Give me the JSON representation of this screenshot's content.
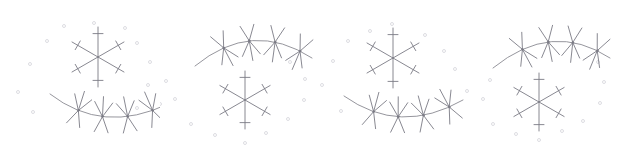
{
  "figure": {
    "background_color": "#ffffff",
    "stroke_color": "#7b7b84",
    "arc_stroke_color": "#8a8a92",
    "speck_color": "#cfcfd6",
    "width": 639,
    "height": 163,
    "panel_count": 4,
    "panel_width": 160
  },
  "panels": [
    {
      "id": "panel-1",
      "x": 0,
      "layout": "star-top-arc-bottom",
      "star": {
        "center_x": 98,
        "center_y": 57,
        "spoke_length": 30,
        "spoke_count": 6,
        "spoke_angles_deg": [
          90,
          30,
          330,
          270,
          210,
          150
        ],
        "barb_position_fraction": 0.78,
        "barb_half_length": 5
      },
      "arc": {
        "start_x": 50,
        "start_y": 94,
        "ctrl_x": 103,
        "ctrl_y": 135,
        "end_x": 168,
        "end_y": 104,
        "orientation": "concave-up",
        "node_count": 4,
        "node_fractions": [
          0.26,
          0.47,
          0.68,
          0.88
        ],
        "branch_up_length": 20,
        "branch_down_length": 18
      },
      "specks": [
        {
          "x": 47,
          "y": 41
        },
        {
          "x": 64,
          "y": 26
        },
        {
          "x": 94,
          "y": 23
        },
        {
          "x": 125,
          "y": 28
        },
        {
          "x": 137,
          "y": 43
        },
        {
          "x": 150,
          "y": 62
        },
        {
          "x": 148,
          "y": 85
        },
        {
          "x": 30,
          "y": 64
        },
        {
          "x": 18,
          "y": 92
        },
        {
          "x": 33,
          "y": 112
        },
        {
          "x": 137,
          "y": 108
        }
      ]
    },
    {
      "id": "panel-2",
      "x": 160,
      "layout": "arc-top-star-bottom",
      "star": {
        "center_x": 245,
        "center_y": 100,
        "spoke_length": 29,
        "spoke_count": 6,
        "spoke_angles_deg": [
          90,
          30,
          330,
          270,
          210,
          150
        ],
        "barb_position_fraction": 0.78,
        "barb_half_length": 5
      },
      "arc": {
        "start_x": 195,
        "start_y": 66,
        "ctrl_x": 252,
        "ctrl_y": 19,
        "end_x": 312,
        "end_y": 58,
        "orientation": "concave-down",
        "node_count": 4,
        "node_fractions": [
          0.25,
          0.47,
          0.69,
          0.9
        ],
        "branch_up_length": 20,
        "branch_down_length": 18
      },
      "specks": [
        {
          "x": 166,
          "y": 81
        },
        {
          "x": 175,
          "y": 99
        },
        {
          "x": 191,
          "y": 124
        },
        {
          "x": 215,
          "y": 135
        },
        {
          "x": 245,
          "y": 143
        },
        {
          "x": 266,
          "y": 133
        },
        {
          "x": 288,
          "y": 119
        },
        {
          "x": 304,
          "y": 100
        },
        {
          "x": 305,
          "y": 79
        },
        {
          "x": 160,
          "y": 104
        },
        {
          "x": 290,
          "y": 62
        }
      ]
    },
    {
      "id": "panel-3",
      "x": 320,
      "layout": "star-top-arc-bottom",
      "star": {
        "center_x": 393,
        "center_y": 58,
        "spoke_length": 30,
        "spoke_count": 6,
        "spoke_angles_deg": [
          90,
          30,
          330,
          270,
          210,
          150
        ],
        "barb_position_fraction": 0.78,
        "barb_half_length": 5
      },
      "arc": {
        "start_x": 344,
        "start_y": 96,
        "ctrl_x": 400,
        "ctrl_y": 136,
        "end_x": 463,
        "end_y": 100,
        "orientation": "concave-up",
        "node_count": 4,
        "node_fractions": [
          0.26,
          0.47,
          0.68,
          0.89
        ],
        "branch_up_length": 20,
        "branch_down_length": 18
      },
      "specks": [
        {
          "x": 392,
          "y": 24
        },
        {
          "x": 370,
          "y": 31
        },
        {
          "x": 348,
          "y": 41
        },
        {
          "x": 425,
          "y": 35
        },
        {
          "x": 444,
          "y": 51
        },
        {
          "x": 455,
          "y": 69
        },
        {
          "x": 467,
          "y": 91
        },
        {
          "x": 333,
          "y": 61
        },
        {
          "x": 322,
          "y": 85
        },
        {
          "x": 341,
          "y": 111
        }
      ]
    },
    {
      "id": "panel-4",
      "x": 480,
      "layout": "arc-top-star-bottom",
      "star": {
        "center_x": 539,
        "center_y": 102,
        "spoke_length": 29,
        "spoke_count": 6,
        "spoke_angles_deg": [
          90,
          30,
          330,
          270,
          210,
          150
        ],
        "barb_position_fraction": 0.78,
        "barb_half_length": 5
      },
      "arc": {
        "start_x": 493,
        "start_y": 68,
        "ctrl_x": 552,
        "ctrl_y": 20,
        "end_x": 610,
        "end_y": 58,
        "orientation": "concave-down",
        "node_count": 4,
        "node_fractions": [
          0.25,
          0.47,
          0.68,
          0.89
        ],
        "branch_up_length": 20,
        "branch_down_length": 18
      },
      "specks": [
        {
          "x": 483,
          "y": 99
        },
        {
          "x": 493,
          "y": 124
        },
        {
          "x": 516,
          "y": 134
        },
        {
          "x": 539,
          "y": 140
        },
        {
          "x": 562,
          "y": 131
        },
        {
          "x": 583,
          "y": 121
        },
        {
          "x": 600,
          "y": 103
        },
        {
          "x": 604,
          "y": 82
        },
        {
          "x": 598,
          "y": 62
        },
        {
          "x": 490,
          "y": 80
        }
      ]
    }
  ]
}
